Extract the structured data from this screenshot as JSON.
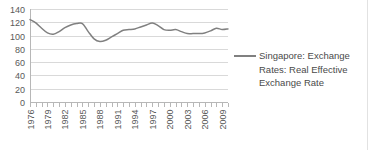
{
  "chart_data": {
    "type": "line",
    "title": "",
    "xlabel": "",
    "ylabel": "",
    "ylim": [
      0,
      140
    ],
    "ytick_values": [
      0,
      20,
      40,
      60,
      80,
      100,
      120,
      140
    ],
    "ytick_labels": [
      "0",
      "20",
      "40",
      "60",
      "80",
      "100",
      "120",
      "140"
    ],
    "grid": true,
    "legend_position": "right",
    "xlim": [
      1976,
      2010
    ],
    "xtick_labels": [
      "1976",
      "1979",
      "1982",
      "1985",
      "1988",
      "1991",
      "1994",
      "1997",
      "2000",
      "2003",
      "2006",
      "2009"
    ],
    "xtick_years": [
      1976,
      1979,
      1982,
      1985,
      1988,
      1991,
      1994,
      1997,
      2000,
      2003,
      2006,
      2009
    ],
    "x": [
      1976,
      1977,
      1978,
      1979,
      1980,
      1981,
      1982,
      1983,
      1984,
      1985,
      1986,
      1987,
      1988,
      1989,
      1990,
      1991,
      1992,
      1993,
      1994,
      1995,
      1996,
      1997,
      1998,
      1999,
      2000,
      2001,
      2002,
      2003,
      2004,
      2005,
      2006,
      2007,
      2008,
      2009,
      2010
    ],
    "series": [
      {
        "name": "Singapore: Exchange Rates: Real Effective Exchange Rate",
        "color": "#808080",
        "values": [
          124,
          119,
          111,
          104,
          102,
          106,
          112,
          116,
          118,
          118,
          106,
          95,
          91,
          93,
          98,
          103,
          108,
          109,
          110,
          113,
          116,
          119,
          115,
          109,
          108,
          109,
          106,
          103,
          103,
          103,
          104,
          107,
          111,
          109,
          110
        ]
      }
    ],
    "legend": [
      {
        "label": "Singapore: Exchange Rates: Real Effective Exchange Rate",
        "color": "#808080"
      }
    ]
  },
  "colors": {
    "series": "#808080",
    "gridline": "#d9d9d9",
    "axis": "#b7b7b7",
    "tick_text": "#595959",
    "legend_text": "#4a4a4a",
    "background": "#ffffff"
  }
}
